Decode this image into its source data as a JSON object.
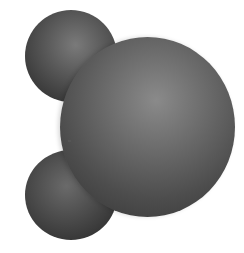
{
  "figure": {
    "spheres": [
      {
        "role": "small-atom-top",
        "color": "#5c5c5c"
      },
      {
        "role": "large-atom-center",
        "color": "#6e6e6e"
      },
      {
        "role": "small-atom-bottom",
        "color": "#525252"
      }
    ],
    "background": "#ffffff"
  }
}
